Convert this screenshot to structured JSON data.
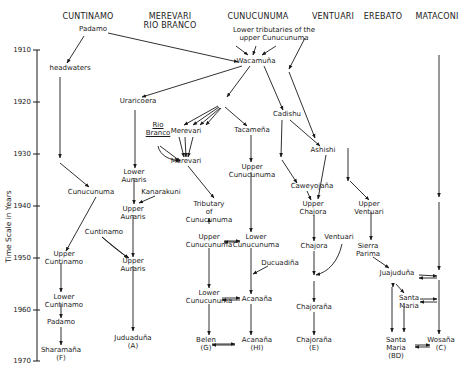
{
  "columns": [
    {
      "id": "cuntinamo",
      "label": "CUNTINAMO",
      "x": 88,
      "y": 12
    },
    {
      "id": "merevari",
      "label": "MEREVARI\nRIO BRANCO",
      "x": 170,
      "y": 12
    },
    {
      "id": "cunucunuma",
      "label": "CUNUCUNUMA",
      "x": 258,
      "y": 12
    },
    {
      "id": "ventuari",
      "label": "VENTUARI",
      "x": 333,
      "y": 12
    },
    {
      "id": "erebato",
      "label": "EREBATO",
      "x": 383,
      "y": 12
    },
    {
      "id": "mataconi",
      "label": "MATACONI",
      "x": 437,
      "y": 12
    }
  ],
  "axis": {
    "label": "Time Scale in Years",
    "x": 37,
    "y_top": 50,
    "y_bottom": 361,
    "ticks": [
      {
        "label": "1910",
        "y": 50
      },
      {
        "label": "1920",
        "y": 102
      },
      {
        "label": "1930",
        "y": 154
      },
      {
        "label": "1940",
        "y": 206
      },
      {
        "label": "1950",
        "y": 258
      },
      {
        "label": "1960",
        "y": 310
      },
      {
        "label": "1970",
        "y": 361
      }
    ]
  },
  "nodes": [
    {
      "id": "padamo_top",
      "label": "Padamo",
      "x": 93,
      "y": 29
    },
    {
      "id": "headwaters",
      "label": "headwaters",
      "x": 70,
      "y": 68
    },
    {
      "id": "lower_tribs",
      "label": "Lower tributaries of the\nupper Cunucunuma",
      "x": 274,
      "y": 30
    },
    {
      "id": "wacamuna",
      "label": "Wacamuña",
      "x": 256,
      "y": 61
    },
    {
      "id": "uraricoera",
      "label": "Uraricoera",
      "x": 138,
      "y": 101
    },
    {
      "id": "cadishu",
      "label": "Cadishu",
      "x": 287,
      "y": 114
    },
    {
      "id": "rio_branco",
      "label": "Rio\nBranco",
      "x": 158,
      "y": 125,
      "underline": true
    },
    {
      "id": "merevari1",
      "label": "Merevari",
      "x": 186,
      "y": 131
    },
    {
      "id": "tacamena",
      "label": "Tacameña",
      "x": 252,
      "y": 130
    },
    {
      "id": "merevari2",
      "label": "Merevari",
      "x": 186,
      "y": 161
    },
    {
      "id": "ashishi",
      "label": "Ashishi",
      "x": 323,
      "y": 150
    },
    {
      "id": "upper_cunucunuma1",
      "label": "Upper\nCunucunuma",
      "x": 252,
      "y": 167
    },
    {
      "id": "cuntinamo_mid",
      "label": "Cunucunuma",
      "x": 91,
      "y": 192
    },
    {
      "id": "lower_auraris",
      "label": "Lower\nAuraris",
      "x": 134,
      "y": 172
    },
    {
      "id": "kanarakuni",
      "label": "Kanarakuni",
      "x": 161,
      "y": 192
    },
    {
      "id": "caweyojana",
      "label": "Caweyojaña",
      "x": 312,
      "y": 186
    },
    {
      "id": "upper_chajora",
      "label": "Upper\nChajora",
      "x": 313,
      "y": 204
    },
    {
      "id": "upper_ventuari",
      "label": "Upper\nVentuari",
      "x": 369,
      "y": 204
    },
    {
      "id": "upper_auraris1",
      "label": "Upper\nAuraris",
      "x": 133,
      "y": 209
    },
    {
      "id": "tributary",
      "label": "Tributary\nof\nCunucunuma",
      "x": 209,
      "y": 204
    },
    {
      "id": "cuntinamo_label",
      "label": "Cuntinamo",
      "x": 104,
      "y": 232
    },
    {
      "id": "upper_cunucunuma2",
      "label": "Upper\nCunucunuma",
      "x": 209,
      "y": 237
    },
    {
      "id": "lower_cunucunuma1",
      "label": "Lower\nCunucunuma",
      "x": 256,
      "y": 237
    },
    {
      "id": "ventuari_side",
      "label": "Ventuari",
      "x": 339,
      "y": 237
    },
    {
      "id": "chajora",
      "label": "Chajora",
      "x": 314,
      "y": 246
    },
    {
      "id": "sierra_parima",
      "label": "Sierra\nParima",
      "x": 368,
      "y": 246
    },
    {
      "id": "upper_cuntinamo",
      "label": "Upper\nCuntinamo",
      "x": 64,
      "y": 254
    },
    {
      "id": "upper_auraris2",
      "label": "Upper\nAuraris",
      "x": 133,
      "y": 261
    },
    {
      "id": "ducuadina",
      "label": "Ducuadiña",
      "x": 280,
      "y": 263
    },
    {
      "id": "juajuduna",
      "label": "Juajuduña",
      "x": 397,
      "y": 273
    },
    {
      "id": "lower_cuntinamo",
      "label": "Lower\nCuntinamo",
      "x": 64,
      "y": 297
    },
    {
      "id": "lower_cunucunuma2",
      "label": "Lower\nCunucunuma",
      "x": 209,
      "y": 293
    },
    {
      "id": "acanana1",
      "label": "Acanaña",
      "x": 257,
      "y": 299
    },
    {
      "id": "chajorana1",
      "label": "Chajoraña",
      "x": 314,
      "y": 307
    },
    {
      "id": "santa_maria1",
      "label": "Santa\nMaria",
      "x": 409,
      "y": 298
    },
    {
      "id": "padamo_bottom",
      "label": "Padamo",
      "x": 61,
      "y": 322
    },
    {
      "id": "juduaduna",
      "label": "Juduaduña\n(A)",
      "x": 133,
      "y": 338
    },
    {
      "id": "belen",
      "label": "Belen\n(G)",
      "x": 206,
      "y": 340
    },
    {
      "id": "acanana2",
      "label": "Acanaña\n(HI)",
      "x": 257,
      "y": 340
    },
    {
      "id": "chajorana2",
      "label": "Chajoraña\n(E)",
      "x": 314,
      "y": 340
    },
    {
      "id": "santa_maria2",
      "label": "Santa\nMaria\n(BD)",
      "x": 396,
      "y": 340
    },
    {
      "id": "wosana",
      "label": "Wosaña\n(C)",
      "x": 441,
      "y": 340
    },
    {
      "id": "sharamana",
      "label": "Sharamaña\n(F)",
      "x": 61,
      "y": 350
    }
  ],
  "edges": [
    {
      "from": [
        108,
        33
      ],
      "to": [
        238,
        62
      ]
    },
    {
      "from": [
        84,
        36
      ],
      "to": [
        67,
        63
      ]
    },
    {
      "from": [
        236,
        46
      ],
      "to": [
        248,
        55
      ]
    },
    {
      "from": [
        256,
        46
      ],
      "to": [
        253,
        55
      ]
    },
    {
      "from": [
        276,
        46
      ],
      "to": [
        262,
        55
      ]
    },
    {
      "from": [
        305,
        38
      ],
      "to": [
        289,
        69
      ]
    },
    {
      "from": [
        242,
        66
      ],
      "to": [
        142,
        97
      ]
    },
    {
      "from": [
        250,
        66
      ],
      "to": [
        227,
        97
      ]
    },
    {
      "from": [
        264,
        66
      ],
      "to": [
        283,
        110
      ]
    },
    {
      "from": [
        289,
        72
      ],
      "to": [
        315,
        138
      ]
    },
    {
      "from": [
        60,
        77
      ],
      "to": [
        60,
        158
      ]
    },
    {
      "from": [
        60,
        163
      ],
      "to": [
        89,
        187
      ]
    },
    {
      "from": [
        135,
        110
      ],
      "to": [
        135,
        168
      ]
    },
    {
      "from": [
        218,
        106
      ],
      "to": [
        184,
        125
      ]
    },
    {
      "from": [
        219,
        107
      ],
      "to": [
        193,
        125
      ]
    },
    {
      "from": [
        220,
        108
      ],
      "to": [
        200,
        125
      ]
    },
    {
      "from": [
        221,
        108
      ],
      "to": [
        206,
        125
      ]
    },
    {
      "from": [
        225,
        107
      ],
      "to": [
        247,
        126
      ]
    },
    {
      "from": [
        179,
        137
      ],
      "to": [
        184,
        157
      ]
    },
    {
      "from": [
        185,
        137
      ],
      "to": [
        186,
        157
      ]
    },
    {
      "from": [
        193,
        137
      ],
      "to": [
        188,
        157
      ]
    },
    {
      "from": [
        160,
        146
      ],
      "to": [
        180,
        161
      ]
    },
    {
      "from": [
        188,
        166
      ],
      "to": [
        214,
        198
      ]
    },
    {
      "from": [
        251,
        135
      ],
      "to": [
        251,
        162
      ]
    },
    {
      "from": [
        282,
        120
      ],
      "to": [
        281,
        157
      ]
    },
    {
      "from": [
        282,
        160
      ],
      "to": [
        297,
        183
      ]
    },
    {
      "from": [
        290,
        120
      ],
      "to": [
        320,
        146
      ]
    },
    {
      "from": [
        326,
        155
      ],
      "to": [
        318,
        199
      ]
    },
    {
      "from": [
        307,
        191
      ],
      "to": [
        311,
        200
      ]
    },
    {
      "from": [
        348,
        148
      ],
      "to": [
        348,
        181
      ]
    },
    {
      "from": [
        350,
        181
      ],
      "to": [
        369,
        200
      ]
    },
    {
      "from": [
        134,
        178
      ],
      "to": [
        134,
        204
      ]
    },
    {
      "from": [
        155,
        196
      ],
      "to": [
        139,
        203
      ]
    },
    {
      "from": [
        96,
        197
      ],
      "to": [
        66,
        251
      ]
    },
    {
      "from": [
        102,
        237
      ],
      "to": [
        128,
        258
      ]
    },
    {
      "from": [
        133,
        215
      ],
      "to": [
        133,
        257
      ]
    },
    {
      "from": [
        133,
        266
      ],
      "to": [
        133,
        331
      ]
    },
    {
      "from": [
        61,
        263
      ],
      "to": [
        61,
        292
      ]
    },
    {
      "from": [
        61,
        304
      ],
      "to": [
        61,
        318
      ]
    },
    {
      "from": [
        61,
        327
      ],
      "to": [
        61,
        345
      ]
    },
    {
      "from": [
        209,
        224
      ],
      "to": [
        209,
        218
      ]
    },
    {
      "from": [
        224,
        241
      ],
      "to": [
        240,
        241
      ]
    },
    {
      "from": [
        240,
        242
      ],
      "to": [
        224,
        242
      ]
    },
    {
      "from": [
        251,
        172
      ],
      "to": [
        251,
        232
      ]
    },
    {
      "from": [
        209,
        248
      ],
      "to": [
        209,
        288
      ]
    },
    {
      "from": [
        251,
        248
      ],
      "to": [
        251,
        294
      ]
    },
    {
      "from": [
        268,
        266
      ],
      "to": [
        253,
        274
      ]
    },
    {
      "from": [
        314,
        215
      ],
      "to": [
        314,
        241
      ]
    },
    {
      "from": [
        314,
        251
      ],
      "to": [
        314,
        275
      ]
    },
    {
      "from": [
        314,
        281
      ],
      "to": [
        314,
        302
      ]
    },
    {
      "from": [
        314,
        312
      ],
      "to": [
        314,
        335
      ]
    },
    {
      "from": [
        251,
        304
      ],
      "to": [
        251,
        335
      ]
    },
    {
      "from": [
        209,
        304
      ],
      "to": [
        209,
        335
      ]
    },
    {
      "from": [
        222,
        298
      ],
      "to": [
        240,
        298
      ]
    },
    {
      "from": [
        240,
        300
      ],
      "to": [
        222,
        300
      ]
    },
    {
      "from": [
        212,
        344
      ],
      "to": [
        235,
        344
      ]
    },
    {
      "from": [
        235,
        345
      ],
      "to": [
        212,
        345
      ]
    },
    {
      "from": [
        371,
        212
      ],
      "to": [
        371,
        240
      ]
    },
    {
      "from": [
        373,
        257
      ],
      "to": [
        389,
        268
      ]
    },
    {
      "from": [
        419,
        275
      ],
      "to": [
        437,
        276
      ]
    },
    {
      "from": [
        437,
        278
      ],
      "to": [
        419,
        278
      ]
    },
    {
      "from": [
        393,
        283
      ],
      "to": [
        393,
        287
      ]
    },
    {
      "from": [
        396,
        284
      ],
      "to": [
        404,
        293
      ]
    },
    {
      "from": [
        392,
        287
      ],
      "to": [
        392,
        332
      ]
    },
    {
      "from": [
        404,
        306
      ],
      "to": [
        404,
        332
      ]
    },
    {
      "from": [
        420,
        299
      ],
      "to": [
        437,
        299
      ]
    },
    {
      "from": [
        437,
        302
      ],
      "to": [
        420,
        302
      ]
    },
    {
      "from": [
        415,
        345
      ],
      "to": [
        430,
        345
      ]
    },
    {
      "from": [
        430,
        347
      ],
      "to": [
        415,
        347
      ]
    },
    {
      "from": [
        439,
        55
      ],
      "to": [
        439,
        197
      ]
    },
    {
      "from": [
        439,
        202
      ],
      "to": [
        439,
        270
      ]
    },
    {
      "from": [
        439,
        280
      ],
      "to": [
        439,
        334
      ]
    }
  ],
  "curves": [
    {
      "d": "M342,244 C338,262 328,272 316,275",
      "arrow": true
    },
    {
      "d": "M158,146 C160,156 170,160 180,161",
      "arrow": true
    },
    {
      "d": "M102,237 C112,246 122,254 129,258",
      "arrow": true
    }
  ]
}
